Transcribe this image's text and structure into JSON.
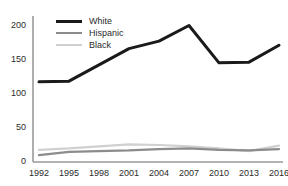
{
  "chart_data": {
    "type": "line",
    "title": "",
    "subtitle": "",
    "xlabel": "",
    "ylabel": "",
    "categories": [
      "1992",
      "1995",
      "1998",
      "2001",
      "2004",
      "2007",
      "2010",
      "2013",
      "2016"
    ],
    "x": [
      1992,
      1995,
      1998,
      2001,
      2004,
      2007,
      2010,
      2013,
      2016
    ],
    "series": [
      {
        "name": "White",
        "color": "#1a1a1a",
        "width": 3,
        "values": [
          118,
          119,
          143,
          167,
          178,
          201,
          146,
          147,
          172
        ]
      },
      {
        "name": "Hispanic",
        "color": "#8c8c8c",
        "width": 2.2,
        "values": [
          10,
          15,
          16,
          17,
          19,
          20,
          18,
          17,
          19
        ]
      },
      {
        "name": "Black",
        "color": "#d0d0d0",
        "width": 2.2,
        "values": [
          18,
          20,
          23,
          26,
          25,
          23,
          20,
          16,
          24
        ]
      }
    ],
    "ylim": [
      0,
      215
    ],
    "yticks": [
      0,
      50,
      100,
      150,
      200
    ],
    "ytick_labels": [
      "0",
      "50",
      "100",
      "150",
      "200"
    ],
    "xtick_labels": [
      "1992",
      "1995",
      "1998",
      "2001",
      "2004",
      "2007",
      "2010",
      "2013",
      "2016"
    ],
    "grid": false,
    "legend_position": "top-left",
    "axis_color": "#9a9a9a",
    "tick_label_color": "#2b2b2b"
  },
  "legend": {
    "items": [
      {
        "label": "White"
      },
      {
        "label": "Hispanic"
      },
      {
        "label": "Black"
      }
    ]
  },
  "axes": {
    "y_labels": [
      "200",
      "150",
      "100",
      "50",
      "0"
    ],
    "x_labels": [
      "1992",
      "1995",
      "1998",
      "2001",
      "2004",
      "2007",
      "2010",
      "2013",
      "2016"
    ]
  }
}
